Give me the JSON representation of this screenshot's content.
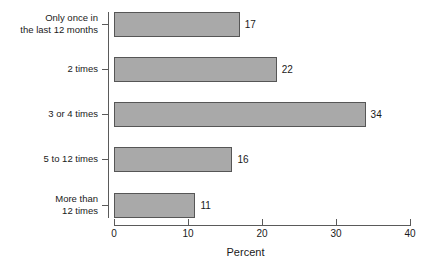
{
  "chart_data": {
    "type": "bar",
    "orientation": "horizontal",
    "title": "",
    "subtitle": "",
    "xlabel": "Percent",
    "ylabel": "",
    "categories": [
      "Only once in\nthe last 12 months",
      "2 times",
      "3 or 4 times",
      "5 to 12 times",
      "More than\n12 times"
    ],
    "values": [
      17,
      22,
      34,
      16,
      11
    ],
    "value_labels": [
      "17",
      "22",
      "34",
      "16",
      "11"
    ],
    "xlim": [
      0,
      40
    ],
    "xticks": [
      0,
      10,
      20,
      30,
      40
    ],
    "xtick_labels": [
      "0",
      "10",
      "20",
      "30",
      "40"
    ],
    "grid": false,
    "legend": null,
    "bar_fill_color": "#a9a9a9",
    "bar_border_color": "#565656",
    "axis_color": "#5a5a5a",
    "text_color": "#1a1a1a",
    "background_color": "#ffffff"
  }
}
